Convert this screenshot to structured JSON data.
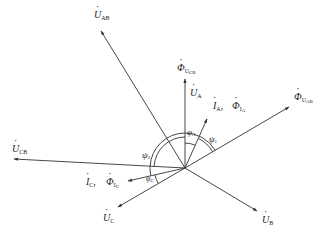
{
  "diagram": {
    "type": "phasor-diagram",
    "origin": [
      185,
      168
    ],
    "colors": {
      "line": "#333333",
      "text": "#222222",
      "background": "#ffffff"
    },
    "vectors": [
      {
        "id": "U_AB",
        "symbol": "U",
        "sub": "AB",
        "end": [
          100,
          30
        ]
      },
      {
        "id": "Phi_UCB",
        "symbol": "Φ",
        "sub": "U",
        "subsub": "CB",
        "end": [
          185,
          78
        ]
      },
      {
        "id": "U_A",
        "symbol": "U",
        "sub": "A",
        "end": [
          185,
          78
        ]
      },
      {
        "id": "I_A",
        "symbol": "I",
        "sub": "A",
        "end": [
          208,
          118
        ]
      },
      {
        "id": "Phi_UAB",
        "symbol": "Φ",
        "sub": "U",
        "subsub": "AB",
        "end": [
          290,
          106
        ]
      },
      {
        "id": "U_CB",
        "symbol": "U",
        "sub": "CB",
        "end": [
          13,
          159
        ]
      },
      {
        "id": "I_C",
        "symbol": "I",
        "sub": "C",
        "end": [
          127,
          181
        ]
      },
      {
        "id": "U_C",
        "symbol": "U",
        "sub": "C",
        "end": [
          117,
          208
        ]
      },
      {
        "id": "U_B",
        "symbol": "U",
        "sub": "B",
        "end": [
          258,
          212
        ]
      }
    ],
    "labels": {
      "u_ab": {
        "sym": "U",
        "sub": "AB"
      },
      "phi_ucb": {
        "sym": "Φ",
        "sub": "U",
        "subsub": "CB"
      },
      "u_a": {
        "sym": "U",
        "sub": "A"
      },
      "i_a": {
        "sym": "I",
        "sub": "A",
        "sep": ","
      },
      "phi_ia": {
        "sym": "Φ",
        "sub": "I",
        "subsub": "A"
      },
      "phi_uab": {
        "sym": "Φ",
        "sub": "U",
        "subsub": "AB"
      },
      "u_cb": {
        "sym": "U",
        "sub": "CB"
      },
      "i_c": {
        "sym": "I",
        "sub": "C",
        "sep": ","
      },
      "phi_ic": {
        "sym": "Φ",
        "sub": "I",
        "subsub": "C"
      },
      "u_c": {
        "sym": "U",
        "sub": "C"
      },
      "u_b": {
        "sym": "U",
        "sub": "B"
      }
    },
    "angles": {
      "phi_a": {
        "sym": "φ",
        "sub": "A"
      },
      "psi_1": {
        "sym": "ψ",
        "sub": "1"
      },
      "psi_2": {
        "sym": "ψ",
        "sub": "2"
      },
      "phi_c": {
        "sym": "φ",
        "sub": "C"
      }
    }
  }
}
